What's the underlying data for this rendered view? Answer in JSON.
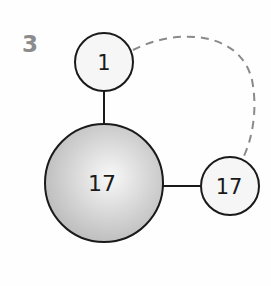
{
  "figure_label": "3",
  "colors": {
    "stroke": "#1a1a1a",
    "dashed": "#8a8a8a",
    "label": "#8c8c8c",
    "small_fill": "#f6f6f6",
    "big_fill_center": "#f7f7f7",
    "big_fill_edge": "#bdbdbd"
  },
  "nodes": [
    {
      "id": "top",
      "label": "1",
      "size": "small"
    },
    {
      "id": "center",
      "label": "17",
      "size": "large"
    },
    {
      "id": "right",
      "label": "17",
      "size": "small"
    }
  ],
  "edges": [
    {
      "from": "top",
      "to": "center",
      "style": "solid"
    },
    {
      "from": "center",
      "to": "right",
      "style": "solid"
    },
    {
      "from": "top",
      "to": "right",
      "style": "dashed"
    }
  ]
}
